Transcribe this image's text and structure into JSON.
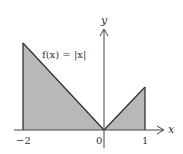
{
  "diagram": {
    "function_label": "f(x) = |x|",
    "axis_x_label": "x",
    "axis_y_label": "y",
    "ticks": [
      {
        "label": "−2",
        "value": -2
      },
      {
        "label": "0",
        "value": 0
      },
      {
        "label": "1",
        "value": 1
      }
    ],
    "shaded_interval": [
      -2,
      1
    ],
    "colors": {
      "fill": "#b8b8b8",
      "stroke": "#333333",
      "axis": "#444444"
    }
  }
}
